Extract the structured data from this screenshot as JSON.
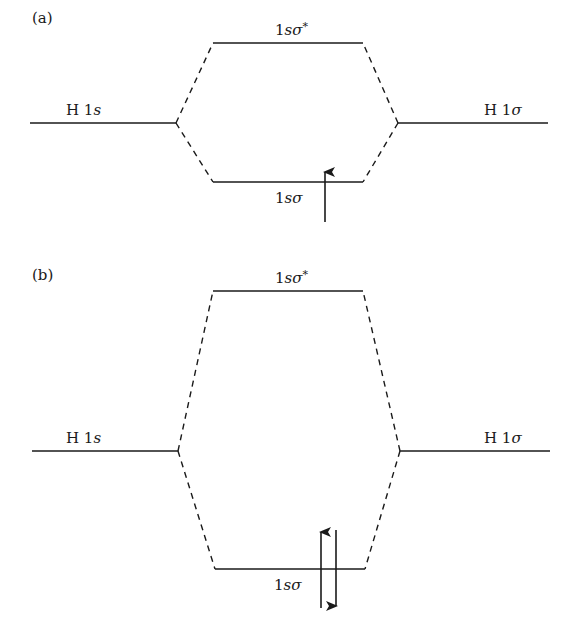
{
  "figure": {
    "panels": [
      {
        "id": "a",
        "label": "(a)",
        "left_atom_label": "H 1",
        "left_atom_orbital": "s",
        "right_atom_label": "H 1",
        "right_atom_orbital": "σ",
        "antibonding_label_prefix": "1",
        "antibonding_label_orbital": "sσ",
        "antibonding_label_star": "*",
        "bonding_label_prefix": "1",
        "bonding_label_orbital": "sσ",
        "bonding_electrons": 1,
        "electron_spins": [
          "up"
        ]
      },
      {
        "id": "b",
        "label": "(b)",
        "left_atom_label": "H 1",
        "left_atom_orbital": "s",
        "right_atom_label": "H 1",
        "right_atom_orbital": "σ",
        "antibonding_label_prefix": "1",
        "antibonding_label_orbital": "sσ",
        "antibonding_label_star": "*",
        "bonding_label_prefix": "1",
        "bonding_label_orbital": "sσ",
        "bonding_electrons": 2,
        "electron_spins": [
          "up",
          "down"
        ]
      }
    ]
  }
}
